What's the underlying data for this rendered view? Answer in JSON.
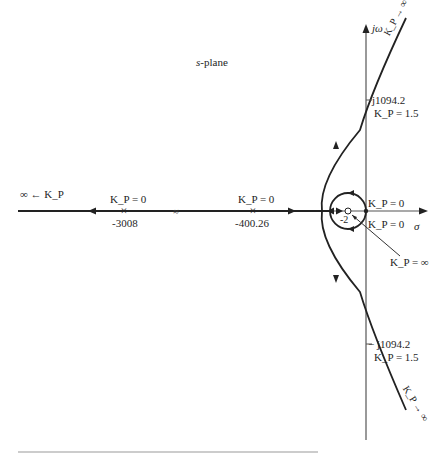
{
  "title": "s-plane",
  "axes": {
    "imag_label": "jω",
    "real_label": "σ"
  },
  "poles": [
    {
      "value": "-3008",
      "gain_label": "K_P = 0"
    },
    {
      "value": "-400.26",
      "gain_label": "K_P = 0"
    }
  ],
  "zero": {
    "value": "-2",
    "gain_label": "K_P = ∞"
  },
  "origin_poles": [
    {
      "gain_label": "K_P = 0"
    },
    {
      "gain_label": "K_P = 0"
    }
  ],
  "crossings": [
    {
      "value": "j1094.2",
      "gain_label": "K_P = 1.5"
    },
    {
      "value": "− j1094.2",
      "gain_label": "K_P = 1.5"
    }
  ],
  "asymptotes": {
    "upper": "K_P → ∞",
    "lower": "K_P → ∞",
    "left": "∞ ← K_P"
  },
  "break_mark": "≈",
  "colors": {
    "line": "#222222",
    "axis": "#555555",
    "background": "#ffffff"
  }
}
